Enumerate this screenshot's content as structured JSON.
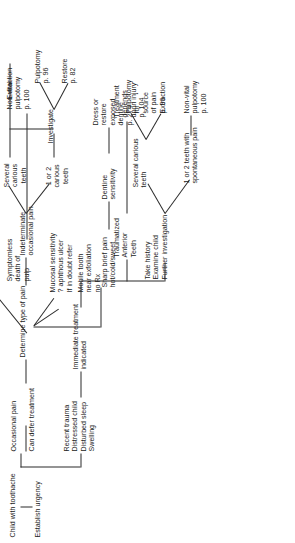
{
  "diagram": {
    "title": "Child with toothache",
    "type": "clinical-decision-flowchart",
    "orientation": "rotated-90-ccw",
    "root": "Child with toothache",
    "nodes": {
      "root": "Child with toothache",
      "establish_urgency": "Establish urgency",
      "occasional_pain": "Occasional pain",
      "recent_trauma": "Recent trauma\nDistressed child\nDisturbed sleep\nSwelling",
      "can_defer": "Can defer treatment",
      "immediate_treatment": "Immediate treatment\nindicated",
      "determine_type": "Determine type of pain",
      "take_history": "Take history\nExamine child\nFurther investigation",
      "traumatized_anterior": "Traumatized\nAnterior\nTeeth",
      "mucosal_sensitivity": "Mucosal sensitivity\n? aphthous ulcer\nIf in doubt refer",
      "mobile_tooth": "Mobile tooth\nnear exfoliation\nno Rx",
      "sharp_brief_pain": "Sharp brief pain\nhot/cold/sweet",
      "indeterminate": "Indeterminate\noccasional pain",
      "symptomless_death": "Symptomless\ndeath of\npulp",
      "one_or_two_spont": "1 or 2 teeth with\nspontaneous pain",
      "several_carious_lower": "Several carious\nteeth",
      "one_or_two_carious": "1 or 2\ncarious\nteeth",
      "several_carious_upper": "Several\ncarious\nteeth",
      "dentine_sensitivity": "Dentine\nsensitivity",
      "investigate": "Investigate",
      "treatment_depends": "Treatment\ndepends\nupon injury\np. 104",
      "nonvital_pulpotomy_lower": "Non-vital\npulpotomy\np. 100",
      "extraction_lower": "Extraction",
      "pulpotomy_source": "Pulpotomy\nfor\nsource\nof pain\np. 96",
      "dress_or_restore": "Dress or\nrestore\nexposed\ndentine\np. 274",
      "restore": "Restore\np. 82",
      "pulpotomy": "Pulpotomy\np. 96",
      "extraction_upper": "Extraction",
      "nonvital_pulpotomy_upper": "Non-vital\npulpotomy\np. 100"
    },
    "page_references": {
      "treatment_depends": "p. 104",
      "nonvital_pulpotomy_lower": "p. 100",
      "pulpotomy_source": "p. 96",
      "dress_or_restore": "p. 274",
      "restore": "p. 82",
      "pulpotomy": "p. 96",
      "nonvital_pulpotomy_upper": "p. 100"
    },
    "colors": {
      "line": "#2b2b2b",
      "text": "#1b1b1b",
      "background": "#ffffff"
    }
  }
}
